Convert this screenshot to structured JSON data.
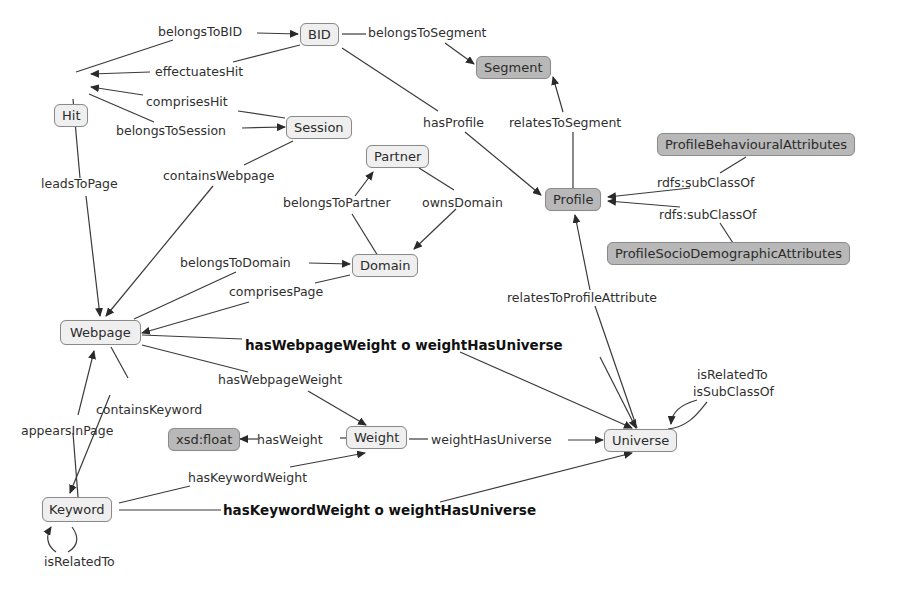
{
  "diagram": {
    "type": "ontology concept map",
    "nodes": {
      "hit": "Hit",
      "bid": "BID",
      "segment": "Segment",
      "session": "Session",
      "partner": "Partner",
      "profile": "Profile",
      "domain": "Domain",
      "profile_behavioural": "ProfileBehaviouralAttributes",
      "profile_sociodemographic": "ProfileSocioDemographicAttributes",
      "webpage": "Webpage",
      "weight": "Weight",
      "xsd_float": "xsd:float",
      "universe": "Universe",
      "keyword": "Keyword"
    },
    "edges": {
      "belongs_to_bid": "belongsToBID",
      "effectuates_hit": "effectuatesHit",
      "belongs_to_segment": "belongsToSegment",
      "comprises_hit": "comprisesHit",
      "belongs_to_session": "belongsToSession",
      "has_profile": "hasProfile",
      "relates_to_segment": "relatesToSegment",
      "leads_to_page": "leadsToPage",
      "contains_webpage": "containsWebpage",
      "belongs_to_partner": "belongsToPartner",
      "owns_domain": "ownsDomain",
      "rdfs_subclassof_1": "rdfs:subClassOf",
      "rdfs_subclassof_2": "rdfs:subClassOf",
      "belongs_to_domain": "belongsToDomain",
      "comprises_page": "comprisesPage",
      "relates_to_profile_attribute": "relatesToProfileAttribute",
      "webpage_weight_chain": "hasWebpageWeight o weightHasUniverse",
      "has_webpage_weight": "hasWebpageWeight",
      "is_related_to_universe": "isRelatedTo",
      "is_subclass_of_universe": "isSubClassOf",
      "contains_keyword": "containsKeyword",
      "appears_in_page": "appearsInPage",
      "has_weight": "hasWeight",
      "weight_has_universe": "weightHasUniverse",
      "has_keyword_weight": "hasKeywordWeight",
      "keyword_weight_chain": "hasKeywordWeight o weightHasUniverse",
      "is_related_to_keyword": "isRelatedTo"
    },
    "colors": {
      "light_node": "#efefef",
      "dark_node": "#b8b8b8",
      "border": "#8a8a8a",
      "line": "#3a3a3a"
    }
  }
}
